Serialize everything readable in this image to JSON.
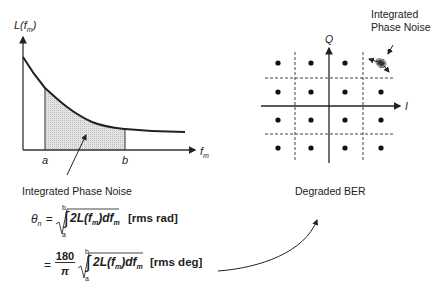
{
  "phase_noise_plot": {
    "y_axis_label": "L(f",
    "y_axis_sub": "m",
    "y_axis_close": ")",
    "x_axis_label": "f",
    "x_axis_sub": "m",
    "marker_a": "a",
    "marker_b": "b",
    "caption": "Integrated Phase Noise",
    "shaded_region": "integration from a to b"
  },
  "constellation": {
    "q_axis_label": "Q",
    "i_axis_label": "I",
    "annotation_line1": "Integrated",
    "annotation_line2": "Phase Noise",
    "caption": "Degraded BER",
    "grid": "4x4 QAM (16 points)"
  },
  "formulas": {
    "theta_symbol": "θ",
    "theta_sub": "n",
    "eq1_unit": "[rms rad]",
    "eq2_coeff_num": "180",
    "eq2_coeff_den": "π",
    "eq2_unit": "[rms deg]",
    "integrand": "2L(f",
    "integrand_sub": "m",
    "integrand_close": ")df",
    "integrand_d_sub": "m",
    "lower_limit": "a",
    "upper_limit": "b",
    "equals": "="
  },
  "colors": {
    "ink": "#222222",
    "shade": "#d9d9d9"
  }
}
